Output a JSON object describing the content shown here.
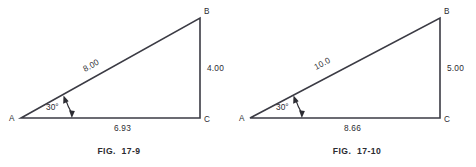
{
  "page": {
    "background": "#ffffff",
    "ink": "#2b2b31",
    "line_color": "#3b3b44"
  },
  "figures": [
    {
      "id": "fig-17-9",
      "caption": "FIG.  17-9",
      "vertices": {
        "a_label": "A",
        "b_label": "B",
        "c_label": "C"
      },
      "angle": {
        "label": "30°",
        "value": 30,
        "at_vertex": "A",
        "marker": "double-headed-arc"
      },
      "sides": {
        "hypotenuse_label": "8.00",
        "vertical_label": "4.00",
        "base_label": "6.93"
      }
    },
    {
      "id": "fig-17-10",
      "caption": "FIG.  17-10",
      "vertices": {
        "a_label": "A",
        "b_label": "B",
        "c_label": "C"
      },
      "angle": {
        "label": "30°",
        "value": 30,
        "at_vertex": "A",
        "marker": "double-headed-arc"
      },
      "sides": {
        "hypotenuse_label": "10.0",
        "vertical_label": "5.00",
        "base_label": "8.66"
      }
    }
  ]
}
